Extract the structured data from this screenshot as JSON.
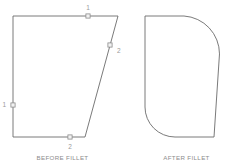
{
  "figure": {
    "type": "cad-fillet-illustration",
    "background_color": "#ffffff",
    "outline_color": "#6b6b6b",
    "marker_fill_color": "#f2f2f2",
    "marker_stroke_color": "#8a8a8a",
    "label_color": "#9a9a9a",
    "caption_color": "#8d8d8d",
    "panels": [
      {
        "id": "before",
        "caption": "BEFORE FILLET",
        "shape": {
          "name": "quadrilateral",
          "corners": [
            {
              "name": "top-left",
              "x": 13,
              "y": 16
            },
            {
              "name": "top-right",
              "x": 118,
              "y": 16
            },
            {
              "name": "bottom-right",
              "x": 85,
              "y": 137
            },
            {
              "name": "bottom-left",
              "x": 13,
              "y": 137
            }
          ],
          "corners_rounded": []
        },
        "markers": [
          {
            "label": "1",
            "edge": "top",
            "x": 88,
            "y": 16,
            "label_x": 88,
            "label_y": 8
          },
          {
            "label": "2",
            "edge": "right",
            "x": 110,
            "y": 45,
            "label_x": 117,
            "label_y": 51
          },
          {
            "label": "1",
            "edge": "left",
            "x": 13,
            "y": 105,
            "label_x": 6,
            "label_y": 105
          },
          {
            "label": "2",
            "edge": "bottom",
            "x": 70,
            "y": 137,
            "label_x": 70,
            "label_y": 147
          }
        ]
      },
      {
        "id": "after",
        "caption": "AFTER FILLET",
        "shape": {
          "name": "quadrilateral-filleted",
          "corners": [
            {
              "name": "top-left",
              "x": 145,
              "y": 16
            },
            {
              "name": "top-right",
              "x": 222,
              "y": 16
            },
            {
              "name": "bottom-right",
              "x": 214,
              "y": 137
            },
            {
              "name": "bottom-left",
              "x": 145,
              "y": 137
            }
          ],
          "corners_rounded": [
            "top-right",
            "bottom-left"
          ],
          "fillet_radius_top_right": 38,
          "fillet_radius_bottom_left": 30
        },
        "markers": []
      }
    ]
  }
}
